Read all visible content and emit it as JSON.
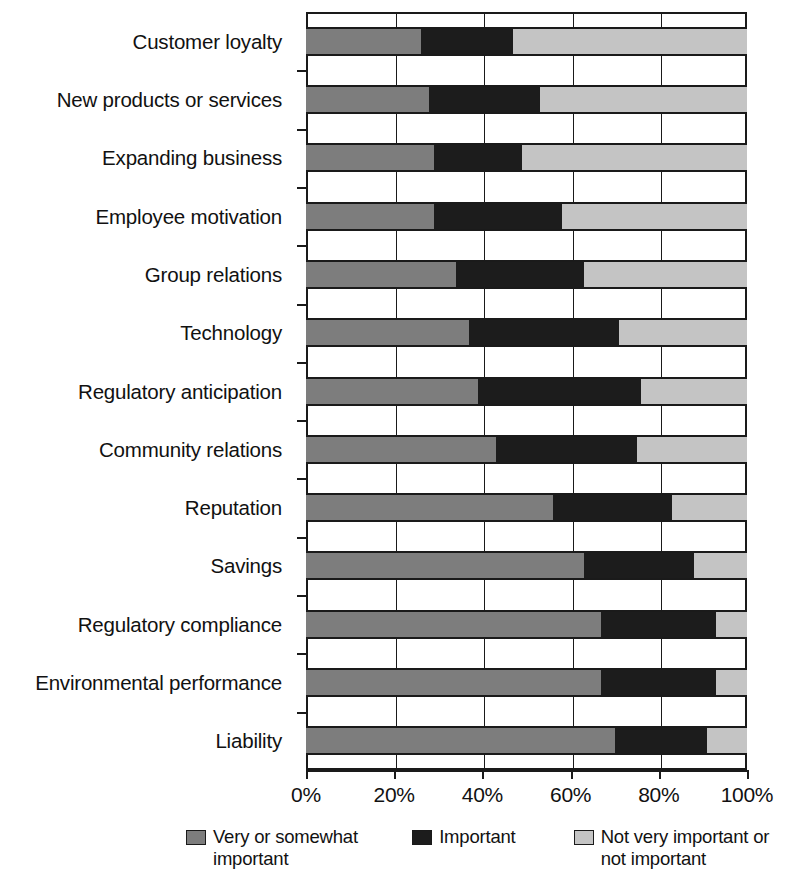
{
  "chart_data": {
    "type": "bar",
    "orientation": "horizontal",
    "stacked": true,
    "normalized": true,
    "title": "",
    "subtitle": "",
    "xlabel": "",
    "ylabel": "",
    "xlim": [
      0,
      100
    ],
    "xticks": [
      0,
      20,
      40,
      60,
      80,
      100
    ],
    "xticklabels": [
      "0%",
      "20%",
      "40%",
      "60%",
      "80%",
      "100%"
    ],
    "grid": "vertical",
    "legend_position": "bottom",
    "categories": [
      "Customer loyalty",
      "New products or services",
      "Expanding business",
      "Employee motivation",
      "Group relations",
      "Technology",
      "Regulatory anticipation",
      "Community relations",
      "Reputation",
      "Savings",
      "Regulatory compliance",
      "Environmental performance",
      "Liability"
    ],
    "series": [
      {
        "name": "Very or somewhat important",
        "color": "#7d7d7d",
        "values": [
          26,
          28,
          29,
          29,
          34,
          37,
          39,
          43,
          56,
          63,
          67,
          67,
          70
        ]
      },
      {
        "name": "Important",
        "color": "#1c1c1c",
        "values": [
          21,
          25,
          20,
          29,
          29,
          34,
          37,
          32,
          27,
          25,
          26,
          26,
          21
        ]
      },
      {
        "name": "Not very important or not important",
        "color": "#c4c4c4",
        "values": [
          53,
          47,
          51,
          42,
          37,
          29,
          24,
          25,
          17,
          12,
          7,
          7,
          9
        ]
      }
    ],
    "cumulative_boundaries": [
      [
        26,
        47
      ],
      [
        28,
        53
      ],
      [
        29,
        49
      ],
      [
        29,
        58
      ],
      [
        34,
        63
      ],
      [
        37,
        71
      ],
      [
        39,
        76
      ],
      [
        43,
        75
      ],
      [
        56,
        83
      ],
      [
        63,
        88
      ],
      [
        67,
        93
      ],
      [
        67,
        93
      ],
      [
        70,
        91
      ]
    ]
  },
  "legend": {
    "items": [
      {
        "label": "Very or somewhat important",
        "swatch": "#7d7d7d"
      },
      {
        "label": "Important",
        "swatch": "#1c1c1c"
      },
      {
        "label": "Not very important or not important",
        "swatch": "#c4c4c4"
      }
    ]
  },
  "colors": {
    "axis": "#1a1a1a",
    "background": "#ffffff",
    "series_very_or_somewhat": "#7d7d7d",
    "series_important": "#1c1c1c",
    "series_not_very": "#c4c4c4"
  }
}
